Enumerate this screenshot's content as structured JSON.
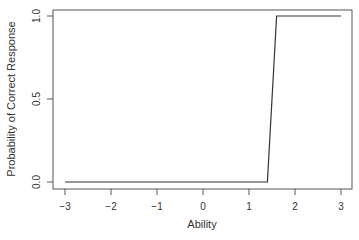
{
  "chart_data": {
    "type": "line",
    "title": "",
    "xlabel": "Ability",
    "ylabel": "Probability of Correct Response",
    "xlim": [
      -3.2,
      3.2
    ],
    "ylim": [
      -0.04,
      1.04
    ],
    "grid": false,
    "legend": null,
    "x_ticks": [
      -3,
      -2,
      -1,
      0,
      1,
      2,
      3
    ],
    "x_tick_labels": [
      "−3",
      "−2",
      "−1",
      "0",
      "1",
      "2",
      "3"
    ],
    "y_ticks": [
      0.0,
      0.5,
      1.0
    ],
    "y_tick_labels": [
      "0.0",
      "0.5",
      "1.0"
    ],
    "series": [
      {
        "name": "Item characteristic curve",
        "color": "#333333",
        "x": [
          -3.0,
          -2.0,
          -1.0,
          0.0,
          1.0,
          1.4,
          1.6,
          2.0,
          3.0
        ],
        "y": [
          0.0,
          0.0,
          0.0,
          0.0,
          0.0,
          0.0,
          1.0,
          1.0,
          1.0
        ]
      }
    ]
  }
}
